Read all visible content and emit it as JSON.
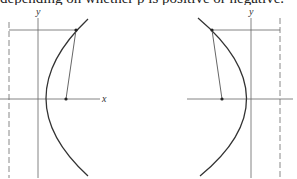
{
  "caption": "depending on whether p is positive or negative.",
  "figures": [
    {
      "name": "parabola-opening-right",
      "axis_labels": {
        "x": "x",
        "y": "y"
      },
      "y_axis_x": 38,
      "x_axis_y": 99,
      "directrix_x": 9,
      "focus": [
        66,
        99
      ],
      "point": [
        76,
        30
      ],
      "curve_path": "M 88 20 Q 5 99 88 175",
      "x_axis": [
        0,
        100
      ],
      "label_positions": {
        "x": [
          102,
          102
        ],
        "y": [
          36,
          15
        ]
      }
    },
    {
      "name": "parabola-opening-left",
      "axis_labels": {
        "y": "y"
      },
      "y_axis_x": 251,
      "x_axis_y": 99,
      "directrix_x": 280,
      "focus": [
        222,
        99
      ],
      "point": [
        212,
        30
      ],
      "curve_path": "M 198 19 Q 294 99 200 176",
      "x_axis": [
        187,
        293
      ],
      "label_positions": {
        "y": [
          249,
          15
        ]
      }
    }
  ],
  "colors": {
    "line": "#555555",
    "curve": "#333333",
    "dashed": "#888888"
  }
}
